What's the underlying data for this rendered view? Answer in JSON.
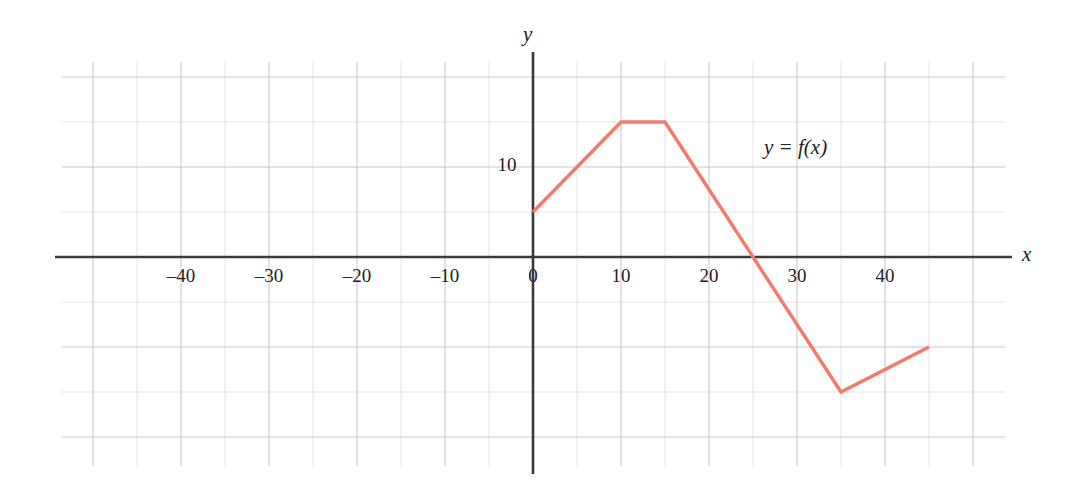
{
  "chart_data": {
    "type": "line",
    "title": "",
    "subtitle": "",
    "xlabel": "x",
    "ylabel": "y",
    "annotations": [
      {
        "text": "y = f(x)",
        "x": 30,
        "y": 12
      }
    ],
    "grid": true,
    "grid_major_step_x": 10,
    "grid_minor_step_x": 5,
    "grid_major_step_y": 10,
    "grid_minor_step_y": 5,
    "legend": "none",
    "xlim": [
      -50,
      48
    ],
    "ylim": [
      -22.5,
      25
    ],
    "xticks": [
      -40,
      -30,
      -20,
      -10,
      0,
      10,
      20,
      30,
      40
    ],
    "xtick_labels": [
      "–40",
      "–30",
      "–20",
      "–10",
      "0",
      "10",
      "20",
      "30",
      "40"
    ],
    "yticks": [
      10
    ],
    "ytick_labels": [
      "10"
    ],
    "series": [
      {
        "name": "f(x)",
        "color": "#F4796B",
        "x": [
          0,
          10,
          15,
          25,
          35,
          45
        ],
        "y": [
          5,
          15,
          15,
          0,
          -15,
          -10
        ],
        "points": [
          {
            "x": 0,
            "y": 5
          },
          {
            "x": 10,
            "y": 15
          },
          {
            "x": 15,
            "y": 15
          },
          {
            "x": 25,
            "y": 0
          },
          {
            "x": 35,
            "y": -15
          },
          {
            "x": 45,
            "y": -10
          }
        ]
      }
    ],
    "colors": {
      "curve": "#F4796B",
      "axis": "#3A3A3A",
      "grid_major": "#C9C9D2",
      "grid_minor": "#E2E2EA",
      "text": "#222222",
      "background": "#FFFFFF"
    }
  }
}
